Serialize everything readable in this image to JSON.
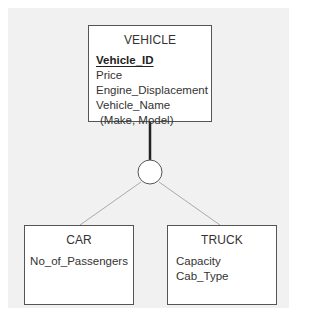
{
  "diagram": {
    "type": "EER specialization diagram",
    "supertype": {
      "name": "VEHICLE",
      "attributes": [
        {
          "label": "Vehicle_ID",
          "key": true
        },
        {
          "label": "Price",
          "key": false
        },
        {
          "label": "Engine_Displacement",
          "key": false
        },
        {
          "label": "Vehicle_Name",
          "key": false
        },
        {
          "label": "(Make, Model)",
          "key": false,
          "composite_parts": true
        }
      ]
    },
    "specialization_symbol": "circle",
    "subtypes": [
      {
        "name": "CAR",
        "attributes": [
          {
            "label": "No_of_Passengers"
          }
        ]
      },
      {
        "name": "TRUCK",
        "attributes": [
          {
            "label": "Capacity"
          },
          {
            "label": "Cab_Type"
          }
        ]
      }
    ],
    "colors": {
      "background": "#f1f1f1",
      "box_fill": "#ffffff",
      "box_border": "#555555",
      "supertype_link": "#222222",
      "subtype_links": "#aaaaaa"
    }
  }
}
